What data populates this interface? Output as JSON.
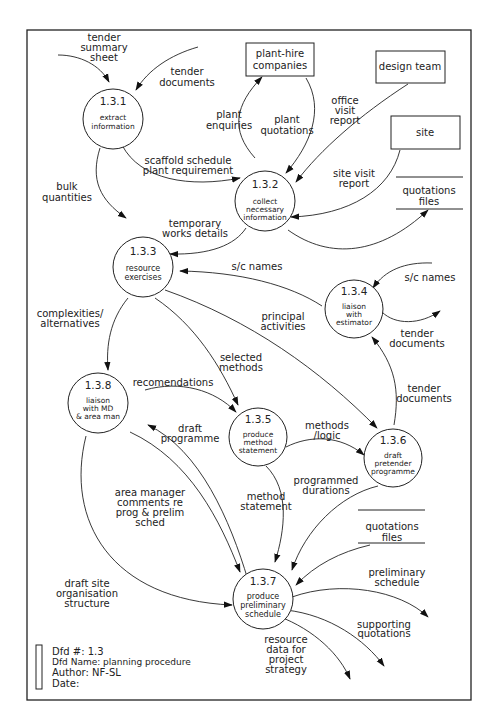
{
  "header": {
    "cut_off_text": "...planning procedure..."
  },
  "diagram": {
    "processes": [
      {
        "id": "1.3.1",
        "name_lines": [
          "extract",
          "information"
        ]
      },
      {
        "id": "1.3.2",
        "name_lines": [
          "collect",
          "necessary",
          "information"
        ]
      },
      {
        "id": "1.3.3",
        "name_lines": [
          "resource",
          "exercises"
        ]
      },
      {
        "id": "1.3.4",
        "name_lines": [
          "liaison",
          "with",
          "estimator"
        ]
      },
      {
        "id": "1.3.5",
        "name_lines": [
          "produce",
          "method",
          "statement"
        ]
      },
      {
        "id": "1.3.6",
        "name_lines": [
          "draft",
          "pretender",
          "programme"
        ]
      },
      {
        "id": "1.3.7",
        "name_lines": [
          "produce",
          "preliminary",
          "schedule"
        ]
      },
      {
        "id": "1.3.8",
        "name_lines": [
          "liaison",
          "with MD",
          "& area man"
        ]
      }
    ],
    "externals": [
      {
        "name_lines": [
          "plant-hire",
          "companies"
        ]
      },
      {
        "name_lines": [
          "design team"
        ]
      },
      {
        "name_lines": [
          "site"
        ]
      }
    ],
    "stores": [
      {
        "name_lines": [
          "quotations",
          "files"
        ]
      },
      {
        "name_lines": [
          "quotations",
          "files"
        ]
      }
    ],
    "flows": {
      "tender_summary_sheet": [
        "tender",
        "summary",
        "sheet"
      ],
      "tender_documents_in": [
        "tender",
        "documents"
      ],
      "plant_enquiries": [
        "plant",
        "enquiries"
      ],
      "plant_quotations": [
        "plant",
        "quotations"
      ],
      "office_visit_report": [
        "office",
        "visit",
        "report"
      ],
      "site_visit_report": [
        "site visit",
        "report"
      ],
      "scaffold_schedule": [
        "scaffold schedule",
        "plant requirement"
      ],
      "bulk_quantities": [
        "bulk",
        "quantities"
      ],
      "temporary_works": [
        "temporary",
        "works details"
      ],
      "sc_names_1": [
        "s/c names"
      ],
      "sc_names_2": [
        "s/c names"
      ],
      "tender_documents_out": [
        "tender",
        "documents"
      ],
      "tender_documents_134": [
        "tender",
        "documents"
      ],
      "complexities": [
        "complexities/",
        "alternatives"
      ],
      "principal_activities": [
        "principal",
        "activities"
      ],
      "selected_methods": [
        "selected",
        "methods"
      ],
      "recomendations": [
        "recomendations"
      ],
      "draft_programme": [
        "draft",
        "programme"
      ],
      "methods_logic": [
        "methods",
        "/logic"
      ],
      "area_manager_comments": [
        "area manager",
        "comments re",
        "prog & prelim",
        "sched"
      ],
      "method_statement": [
        "method",
        "statement"
      ],
      "programmed_durations": [
        "programmed",
        "durations"
      ],
      "draft_site_org": [
        "draft site",
        "organisation",
        "structure"
      ],
      "preliminary_schedule": [
        "preliminary",
        "schedule"
      ],
      "supporting_quotations": [
        "supporting",
        "quotations"
      ],
      "resource_data": [
        "resource",
        "data for",
        "project",
        "strategy"
      ]
    }
  },
  "legend": {
    "dfd_number": "Dfd #: 1.3",
    "dfd_name": "Dfd Name: planning procedure",
    "author": "Author: NF-SL",
    "date": "Date:"
  }
}
